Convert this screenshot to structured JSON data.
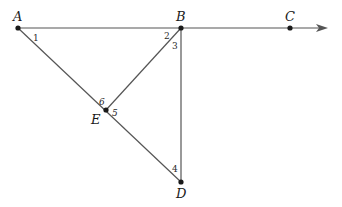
{
  "diagram": {
    "points": {
      "A": {
        "label": "A",
        "x": 18,
        "y": 28
      },
      "B": {
        "label": "B",
        "x": 181,
        "y": 28
      },
      "C": {
        "label": "C",
        "x": 290,
        "y": 28
      },
      "D": {
        "label": "D",
        "x": 181,
        "y": 182
      },
      "E": {
        "label": "E",
        "x": 106,
        "y": 110
      }
    },
    "ray": {
      "from": "A",
      "through": "C",
      "arrow_tip_x": 327
    },
    "segments": [
      [
        "A",
        "B"
      ],
      [
        "B",
        "C"
      ],
      [
        "A",
        "E"
      ],
      [
        "E",
        "D"
      ],
      [
        "B",
        "E"
      ],
      [
        "B",
        "D"
      ]
    ],
    "angle_labels": [
      {
        "label": "1",
        "at": "A"
      },
      {
        "label": "2",
        "at": "B"
      },
      {
        "label": "3",
        "at": "B"
      },
      {
        "label": "4",
        "at": "D"
      },
      {
        "label": "5",
        "at": "E"
      },
      {
        "label": "6",
        "at": "E"
      }
    ],
    "colors": {
      "line": "#555555",
      "point": "#1a1a1a",
      "text": "#1a1a1a"
    }
  }
}
